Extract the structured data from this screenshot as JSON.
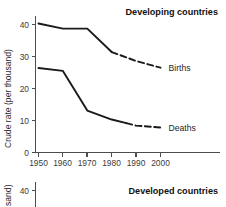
{
  "figure": {
    "background_color": "#ffffff",
    "ink_color": "#1a1a1a",
    "axis_color": "#4d4d4d"
  },
  "panels": {
    "top": {
      "title": "Developing countries",
      "ylabel": "Crude rate (per thousand)",
      "y_ticks": [
        "0",
        "10",
        "20",
        "30",
        "40"
      ],
      "x_ticks": [
        "1950",
        "1960",
        "1970",
        "1980",
        "1990",
        "2000"
      ],
      "series_labels": {
        "births": "Births",
        "deaths": "Deaths"
      }
    },
    "bottom": {
      "title": "Developed countries",
      "ylabel_partial": "sand)",
      "y_ticks": [
        "40"
      ]
    }
  },
  "chart_data": [
    {
      "type": "line",
      "title": "Developing countries",
      "xlabel": "",
      "ylabel": "Crude rate (per thousand)",
      "xlim": [
        1950,
        2000
      ],
      "ylim": [
        0,
        43
      ],
      "x_ticks": [
        1950,
        1960,
        1970,
        1980,
        1990,
        2000
      ],
      "y_ticks": [
        0,
        10,
        20,
        30,
        40
      ],
      "grid": false,
      "legend": "inline-right-labels",
      "x": [
        1950,
        1960,
        1970,
        1980,
        1990,
        2000
      ],
      "series": [
        {
          "name": "Births",
          "values": [
            40.3,
            38.7,
            38.7,
            31.4,
            28.6,
            26.5
          ],
          "solid_until": 1980,
          "dashed_from": 1980,
          "label": "Births"
        },
        {
          "name": "Deaths",
          "values": [
            26.4,
            25.5,
            13.1,
            10.3,
            8.4,
            7.8
          ],
          "solid_until": 1986,
          "dashed_from": 1986,
          "label": "Deaths"
        }
      ]
    },
    {
      "type": "line",
      "title": "Developed countries",
      "ylabel": "Crude rate (per thousand)",
      "y_ticks": [
        40
      ],
      "grid": false,
      "note": "partially visible, cropped at image bottom edge",
      "x": [],
      "series": []
    }
  ]
}
